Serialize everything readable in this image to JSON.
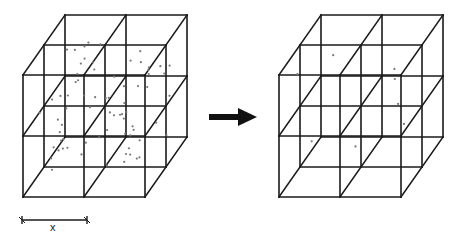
{
  "diagram": {
    "left_lattice": {
      "grid": {
        "nx": 2,
        "ny": 2,
        "nz": 2
      },
      "cell_size": 61,
      "depth_step": [
        21,
        -30
      ],
      "origin": [
        23,
        75
      ],
      "particles_per_cell": "many",
      "particle_color": "#777777"
    },
    "arrow": {
      "from": [
        209,
        117
      ],
      "to": [
        257,
        117
      ],
      "color": "#111111"
    },
    "right_lattice": {
      "grid": {
        "nx": 2,
        "ny": 2,
        "nz": 2
      },
      "cell_size": 61,
      "depth_step": [
        21,
        -30
      ],
      "origin": [
        279,
        75
      ],
      "particles_per_cell": "one",
      "particle_color": "#777777"
    },
    "scale_bar": {
      "label": "x",
      "x1": 22,
      "x2": 87,
      "y": 220
    }
  }
}
